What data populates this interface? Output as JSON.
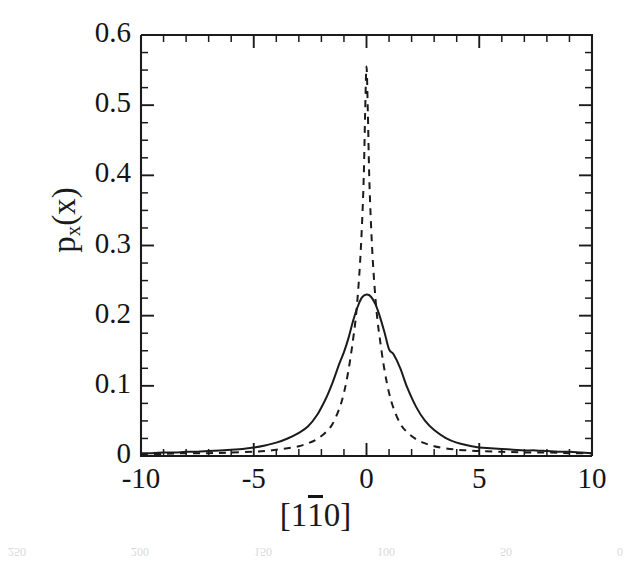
{
  "figure": {
    "kind": "scanned-journal-figure",
    "background_color": "#ffffff",
    "ink_color": "#1b1b1b"
  },
  "axes": {
    "x_tick_labels": [
      "-10",
      "-5",
      "0",
      "5",
      "10"
    ],
    "y_tick_labels": [
      "0",
      "0.1",
      "0.2",
      "0.3",
      "0.4",
      "0.5",
      "0.6"
    ],
    "x_title_parts": {
      "open_bracket": "[",
      "first": "1",
      "barred": "1",
      "last": "0",
      "close_bracket": "]"
    },
    "y_title_parts": {
      "base": "p",
      "subscript": "x",
      "argument": "(x)"
    }
  },
  "scan_bleed": {
    "top_text": "",
    "bottom_labels": [
      "250",
      "200",
      "150",
      "100",
      "50",
      "0"
    ]
  },
  "chart_data": {
    "type": "line",
    "title": "",
    "xlabel": "[1̅1 0]",
    "ylabel": "p_x(x)",
    "xlim": [
      -10,
      10
    ],
    "ylim": [
      0,
      0.6
    ],
    "x_major_ticks": [
      -10,
      -5,
      0,
      5,
      10
    ],
    "x_minor_tick_step": 1,
    "y_major_ticks": [
      0,
      0.1,
      0.2,
      0.3,
      0.4,
      0.5,
      0.6
    ],
    "y_minor_tick_step": 0.025,
    "grid": false,
    "legend": "none",
    "tick_direction": "in",
    "series": [
      {
        "name": "solid",
        "style": "solid",
        "color": "#1b1b1b",
        "x": [
          -10,
          -9.5,
          -9,
          -8.5,
          -8,
          -7.5,
          -7,
          -6.5,
          -6,
          -5.5,
          -5,
          -4.5,
          -4,
          -3.5,
          -3,
          -2.6,
          -2.2,
          -1.8,
          -1.5,
          -1.2,
          -1.0,
          -0.8,
          -0.6,
          -0.4,
          -0.2,
          0,
          0.2,
          0.4,
          0.6,
          0.8,
          1.0,
          1.2,
          1.5,
          1.8,
          2.2,
          2.6,
          3,
          3.5,
          4,
          4.5,
          5,
          5.5,
          6,
          6.5,
          7,
          7.5,
          8,
          8.5,
          9,
          9.5,
          10
        ],
        "y": [
          0.004,
          0.004,
          0.005,
          0.005,
          0.006,
          0.006,
          0.007,
          0.008,
          0.009,
          0.01,
          0.012,
          0.015,
          0.019,
          0.025,
          0.033,
          0.042,
          0.058,
          0.082,
          0.105,
          0.132,
          0.148,
          0.168,
          0.192,
          0.212,
          0.226,
          0.23,
          0.227,
          0.216,
          0.198,
          0.176,
          0.152,
          0.145,
          0.125,
          0.098,
          0.07,
          0.05,
          0.037,
          0.026,
          0.019,
          0.015,
          0.012,
          0.011,
          0.01,
          0.009,
          0.008,
          0.008,
          0.007,
          0.006,
          0.006,
          0.005,
          0.004
        ]
      },
      {
        "name": "dashed",
        "style": "dashed",
        "color": "#1b1b1b",
        "x": [
          -10,
          -9,
          -8,
          -7,
          -6,
          -5,
          -4.5,
          -4,
          -3.5,
          -3,
          -2.6,
          -2.2,
          -1.8,
          -1.5,
          -1.2,
          -1.0,
          -0.8,
          -0.6,
          -0.45,
          -0.3,
          -0.2,
          -0.12,
          -0.06,
          0,
          0.06,
          0.12,
          0.2,
          0.3,
          0.45,
          0.6,
          0.8,
          1.0,
          1.2,
          1.5,
          1.8,
          2.2,
          2.6,
          3,
          3.5,
          4,
          4.5,
          5,
          6,
          7,
          8,
          9,
          10
        ],
        "y": [
          0.003,
          0.003,
          0.004,
          0.004,
          0.005,
          0.006,
          0.007,
          0.009,
          0.011,
          0.014,
          0.018,
          0.024,
          0.034,
          0.046,
          0.068,
          0.09,
          0.122,
          0.165,
          0.205,
          0.268,
          0.33,
          0.4,
          0.49,
          0.555,
          0.49,
          0.4,
          0.33,
          0.268,
          0.205,
          0.165,
          0.122,
          0.09,
          0.068,
          0.046,
          0.034,
          0.024,
          0.018,
          0.014,
          0.011,
          0.009,
          0.008,
          0.007,
          0.006,
          0.005,
          0.005,
          0.004,
          0.004
        ]
      }
    ]
  }
}
